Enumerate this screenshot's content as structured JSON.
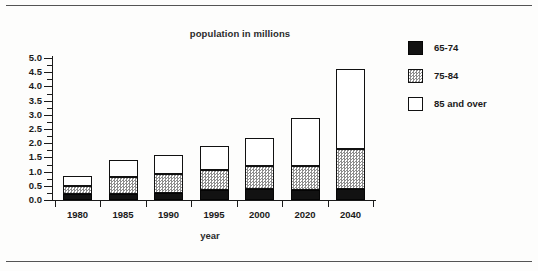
{
  "document": {
    "has_top_rule": true,
    "has_bottom_rule": true
  },
  "chart_data": {
    "type": "bar",
    "subtype": "stacked-bar",
    "title": "population in millions",
    "xlabel": "year",
    "ylabel": "",
    "categories": [
      "1980",
      "1985",
      "1990",
      "1995",
      "2000",
      "2020",
      "2040"
    ],
    "series": [
      {
        "name": "65-74",
        "color": "#121212",
        "pattern": "solid-black",
        "values": [
          0.2,
          0.2,
          0.25,
          0.35,
          0.4,
          0.35,
          0.4
        ]
      },
      {
        "name": "75-84",
        "color": "#8d8d8d",
        "pattern": "stipple",
        "values": [
          0.3,
          0.6,
          0.65,
          0.7,
          0.8,
          0.85,
          1.4
        ]
      },
      {
        "name": "85 and over",
        "color": "#ffffff",
        "pattern": "white",
        "values": [
          0.35,
          0.6,
          0.7,
          0.85,
          1.0,
          1.7,
          2.8
        ]
      }
    ],
    "totals": [
      0.85,
      1.4,
      1.6,
      1.9,
      2.2,
      2.9,
      4.6
    ],
    "ylim": [
      0.0,
      5.0
    ],
    "ytick_step": 0.5,
    "yticks": [
      "0.0",
      "0.5",
      "1.0",
      "1.5",
      "2.0",
      "2.5",
      "3.0",
      "3.5",
      "4.0",
      "4.5",
      "5.0"
    ],
    "minor_ticks": true,
    "grid": false,
    "legend_position": "right",
    "legend": [
      {
        "label": "65-74",
        "swatch": "solid-black"
      },
      {
        "label": "75-84",
        "swatch": "stipple"
      },
      {
        "label": "85 and over",
        "swatch": "white"
      }
    ]
  }
}
